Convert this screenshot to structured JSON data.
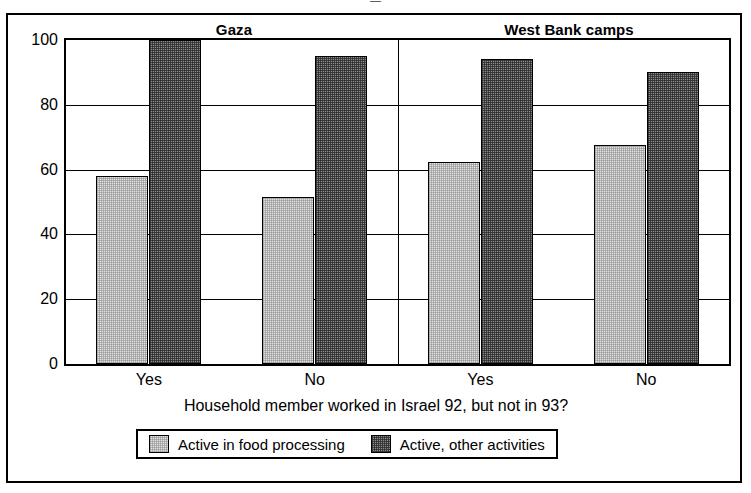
{
  "top_sliver_text": "—",
  "chart_data": {
    "type": "bar",
    "title": "",
    "panels": [
      {
        "label": "Gaza"
      },
      {
        "label": "West Bank camps"
      }
    ],
    "categories": [
      "Yes",
      "No",
      "Yes",
      "No"
    ],
    "series": [
      {
        "name": "Active in food processing",
        "swatch": "light",
        "color": "#e2e2e2",
        "values": [
          58,
          51.5,
          62.5,
          67.5
        ]
      },
      {
        "name": "Active, other activities",
        "swatch": "dark",
        "color": "#8a8a8a",
        "values": [
          100,
          95,
          94,
          90
        ]
      }
    ],
    "xlabel": "Household member worked in Israel 92, but not in 93?",
    "ylabel": "",
    "ylim": [
      0,
      100
    ],
    "yticks": [
      100,
      80,
      60,
      40,
      20,
      0
    ],
    "ytick_labels": [
      "100",
      "80",
      "60",
      "40",
      "20",
      "0"
    ],
    "grid": true,
    "legend_position": "bottom",
    "legend": [
      {
        "label": "Active in food processing",
        "swatch": "light"
      },
      {
        "label": "Active, other activities",
        "swatch": "dark"
      }
    ]
  }
}
